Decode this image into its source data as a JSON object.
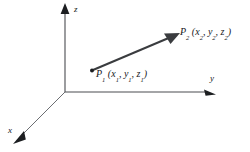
{
  "figure": {
    "type": "3d-vector-diagram",
    "background_color": "#ffffff",
    "stroke_color": "#26282b",
    "axes": {
      "z": {
        "label": "z",
        "direction": "up",
        "arrow": true
      },
      "y": {
        "label": "y",
        "direction": "right",
        "arrow": true
      },
      "x": {
        "label": "x",
        "direction": "down-left",
        "arrow": true
      }
    },
    "points": [
      {
        "name": "P1",
        "label_main": "P",
        "label_sub": "1",
        "coordinates_text": "(x1, y1, z1)",
        "coord_parts": [
          "x",
          "1",
          "y",
          "1",
          "z",
          "1"
        ],
        "marker": "dot"
      },
      {
        "name": "P2",
        "label_main": "P",
        "label_sub": "2",
        "coordinates_text": "(x2, y2, z2)",
        "coord_parts": [
          "x",
          "2",
          "y",
          "2",
          "z",
          "2"
        ],
        "marker": "arrowhead"
      }
    ],
    "vector": {
      "from": "P1",
      "to": "P2",
      "arrow": true,
      "color": "#3a3c3f"
    }
  }
}
